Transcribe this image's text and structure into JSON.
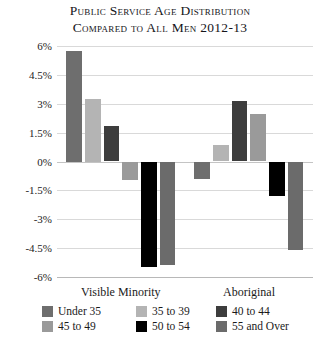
{
  "chart_data": {
    "type": "bar",
    "title": "Public Service Age Distribution Compared to All Men 2012-13",
    "title_lines": [
      "Public Service Age Distribution",
      "Compared to All Men 2012-13"
    ],
    "xlabel": "",
    "ylabel": "",
    "ylim": [
      -6,
      6
    ],
    "grid": true,
    "legend_position": "bottom",
    "ytick_labels": [
      "6%",
      "4.5%",
      "3%",
      "1.5%",
      "0%",
      "-1.5%",
      "-3%",
      "-4.5%",
      "-6%"
    ],
    "ytick_values": [
      6,
      4.5,
      3,
      1.5,
      0,
      -1.5,
      -3,
      -4.5,
      -6
    ],
    "categories": [
      "Visible Minority",
      "Aboriginal"
    ],
    "series": [
      {
        "name": "Under 35",
        "color": "#6e6e6e",
        "values": [
          5.75,
          -0.9
        ]
      },
      {
        "name": "35 to 39",
        "color": "#b4b4b4",
        "values": [
          3.25,
          0.85
        ]
      },
      {
        "name": "40 to 44",
        "color": "#3d3d3d",
        "values": [
          1.85,
          3.15
        ]
      },
      {
        "name": "45 to 49",
        "color": "#9a9a9a",
        "values": [
          -0.95,
          2.45
        ]
      },
      {
        "name": "50 to 54",
        "color": "#000000",
        "values": [
          -5.5,
          -1.8
        ]
      },
      {
        "name": "55 and Over",
        "color": "#6b6b6b",
        "values": [
          -5.4,
          -4.6
        ]
      }
    ]
  },
  "legend": {
    "items": [
      {
        "label": "Under 35",
        "color": "#6e6e6e"
      },
      {
        "label": "35 to 39",
        "color": "#b4b4b4"
      },
      {
        "label": "40 to 44",
        "color": "#3d3d3d"
      },
      {
        "label": "45 to 49",
        "color": "#9a9a9a"
      },
      {
        "label": "50 to 54",
        "color": "#000000"
      },
      {
        "label": "55 and Over",
        "color": "#6b6b6b"
      }
    ]
  }
}
